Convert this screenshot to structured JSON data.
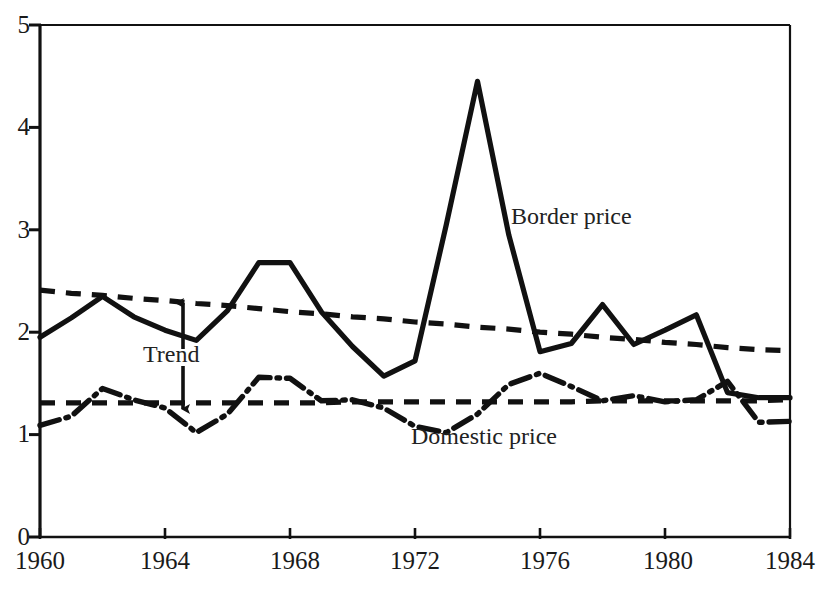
{
  "chart_data": {
    "type": "line",
    "title": "",
    "subtitle": "",
    "xlabel": "",
    "ylabel": "",
    "xlim": [
      1960,
      1984
    ],
    "ylim": [
      0,
      5
    ],
    "grid": false,
    "legend_position": "inline-annotations",
    "x_ticks": [
      "1960",
      "1964",
      "1968",
      "1972",
      "1976",
      "1980",
      "1984"
    ],
    "x_tick_values": [
      1960,
      1964,
      1968,
      1972,
      1976,
      1980,
      1984
    ],
    "y_ticks": [
      "0",
      "1",
      "2",
      "3",
      "4",
      "5"
    ],
    "y_tick_values": [
      0,
      1,
      2,
      3,
      4,
      5
    ],
    "x": [
      1960,
      1961,
      1962,
      1963,
      1964,
      1965,
      1966,
      1967,
      1968,
      1969,
      1970,
      1971,
      1972,
      1973,
      1974,
      1975,
      1976,
      1977,
      1978,
      1979,
      1980,
      1981,
      1982,
      1983,
      1984
    ],
    "series": [
      {
        "name": "Border price",
        "style": "solid",
        "color": "#111111",
        "values": [
          1.95,
          2.14,
          2.35,
          2.15,
          2.02,
          1.92,
          2.21,
          2.68,
          2.68,
          2.2,
          1.86,
          1.57,
          1.72,
          3.05,
          4.45,
          2.95,
          1.81,
          1.89,
          2.27,
          1.88,
          2.02,
          2.17,
          1.41,
          1.36,
          1.36
        ]
      },
      {
        "name": "Domestic price",
        "style": "dash-dot",
        "color": "#111111",
        "values": [
          1.09,
          1.18,
          1.45,
          1.34,
          1.26,
          1.02,
          1.2,
          1.56,
          1.55,
          1.33,
          1.34,
          1.26,
          1.08,
          1.02,
          1.2,
          1.49,
          1.6,
          1.47,
          1.33,
          1.38,
          1.32,
          1.34,
          1.52,
          1.12,
          1.13
        ]
      },
      {
        "name": "Trend (border)",
        "style": "dashed",
        "color": "#111111",
        "values": [
          2.41,
          2.38,
          2.36,
          2.33,
          2.31,
          2.28,
          2.26,
          2.23,
          2.2,
          2.18,
          2.15,
          2.13,
          2.1,
          2.08,
          2.05,
          2.03,
          2.0,
          1.98,
          1.95,
          1.93,
          1.9,
          1.88,
          1.85,
          1.83,
          1.82
        ]
      },
      {
        "name": "Trend (domestic)",
        "style": "dashed",
        "color": "#111111",
        "values": [
          1.31,
          1.31,
          1.31,
          1.31,
          1.31,
          1.31,
          1.31,
          1.31,
          1.31,
          1.31,
          1.32,
          1.32,
          1.32,
          1.32,
          1.32,
          1.32,
          1.32,
          1.32,
          1.33,
          1.33,
          1.33,
          1.33,
          1.33,
          1.33,
          1.34
        ]
      }
    ],
    "annotations": [
      {
        "name": "border-price-label",
        "text": "Border price",
        "x": 1974.8,
        "y": 3.08
      },
      {
        "name": "domestic-price-label",
        "text": "Domestic price",
        "x": 1971.6,
        "y": 1.07
      },
      {
        "name": "trend-label",
        "text": "Trend",
        "x": 1963.9,
        "y": 1.7
      }
    ]
  },
  "axis": {
    "y_labels": [
      "5",
      "4",
      "3",
      "2",
      "1",
      "0"
    ],
    "x_labels": [
      "1960",
      "1964",
      "1968",
      "1972",
      "1976",
      "1980",
      "1984"
    ]
  },
  "labels": {
    "border_price": "Border price",
    "domestic_price": "Domestic price",
    "trend": "Trend"
  }
}
